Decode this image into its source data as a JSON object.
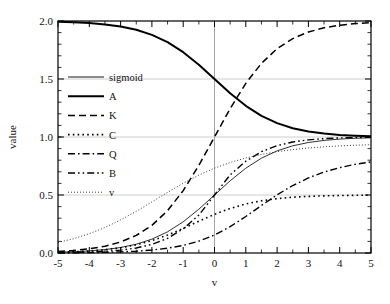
{
  "chart_data": {
    "type": "line",
    "title": "",
    "xlabel": "v",
    "ylabel": "value",
    "xlim": [
      -5,
      5
    ],
    "ylim": [
      0,
      2
    ],
    "grid": true,
    "grid_axis": "y",
    "legend_position": "upper-left-inside",
    "xticks": [
      "-5",
      "-4",
      "-3",
      "-2",
      "-1",
      "0",
      "1",
      "2",
      "3",
      "4",
      "5"
    ],
    "xtick_values": [
      -5,
      -4,
      -3,
      -2,
      -1,
      0,
      1,
      2,
      3,
      4,
      5
    ],
    "yticks": [
      "0.0",
      "0.5",
      "1.0",
      "1.5",
      "2.0"
    ],
    "ytick_values": [
      0,
      0.5,
      1.0,
      1.5,
      2.0
    ],
    "x": [
      -5,
      -4.5,
      -4,
      -3.5,
      -3,
      -2.5,
      -2,
      -1.5,
      -1,
      -0.5,
      0,
      0.5,
      1,
      1.5,
      2,
      2.5,
      3,
      3.5,
      4,
      4.5,
      5
    ],
    "series": [
      {
        "name": "sigmoid",
        "style": "solid",
        "width": 0.9,
        "color": "#1a1a1a",
        "values": [
          0.0067,
          0.011,
          0.018,
          0.0293,
          0.0474,
          0.0759,
          0.1192,
          0.1824,
          0.2689,
          0.3775,
          0.5,
          0.6225,
          0.7311,
          0.8176,
          0.8808,
          0.9241,
          0.9526,
          0.9707,
          0.982,
          0.989,
          0.9933
        ]
      },
      {
        "name": "A",
        "style": "solid",
        "width": 2.0,
        "color": "#000000",
        "values": [
          1.9933,
          1.989,
          1.982,
          1.9707,
          1.9526,
          1.9241,
          1.8808,
          1.8176,
          1.7311,
          1.6225,
          1.5,
          1.3775,
          1.2689,
          1.1824,
          1.1192,
          1.0759,
          1.0474,
          1.0293,
          1.018,
          1.011,
          1.0067
        ]
      },
      {
        "name": "K",
        "style": "dashed",
        "width": 1.5,
        "color": "#000000",
        "values": [
          0.0135,
          0.022,
          0.0359,
          0.0585,
          0.0949,
          0.1517,
          0.2384,
          0.3647,
          0.5379,
          0.7551,
          1.0,
          1.2449,
          1.4621,
          1.6353,
          1.7616,
          1.8483,
          1.9051,
          1.9415,
          1.9641,
          1.978,
          1.9866
        ]
      },
      {
        "name": "C",
        "style": "dotted",
        "width": 1.6,
        "color": "#000000",
        "values": [
          0.0067,
          0.0109,
          0.0177,
          0.0285,
          0.0453,
          0.0706,
          0.1066,
          0.1543,
          0.2119,
          0.2742,
          0.3333,
          0.3837,
          0.4226,
          0.4503,
          0.4689,
          0.4808,
          0.488,
          0.4925,
          0.4954,
          0.4972,
          0.4983
        ]
      },
      {
        "name": "Q",
        "style": "dashdot",
        "width": 1.4,
        "color": "#000000",
        "values": [
          0.0013,
          0.0022,
          0.0036,
          0.0059,
          0.0097,
          0.0157,
          0.0256,
          0.0412,
          0.0654,
          0.1019,
          0.155,
          0.2269,
          0.3147,
          0.41,
          0.5017,
          0.5818,
          0.6469,
          0.6976,
          0.736,
          0.7646,
          0.7857
        ]
      },
      {
        "name": "B",
        "style": "dashdotdot",
        "width": 1.4,
        "color": "#000000",
        "values": [
          0.0025,
          0.0045,
          0.0079,
          0.0141,
          0.0247,
          0.0431,
          0.0744,
          0.1265,
          0.2086,
          0.3263,
          0.5,
          0.6737,
          0.7914,
          0.8735,
          0.9256,
          0.9569,
          0.9753,
          0.9859,
          0.9921,
          0.9955,
          0.9975
        ]
      },
      {
        "name": "v",
        "style": "finedotted",
        "width": 1.0,
        "color": "#3a3a3a",
        "values": [
          0.0909,
          0.1237,
          0.1663,
          0.2199,
          0.2847,
          0.3594,
          0.4404,
          0.5227,
          0.601,
          0.6712,
          0.7311,
          0.7803,
          0.8194,
          0.8499,
          0.8735,
          0.8914,
          0.9051,
          0.9153,
          0.9231,
          0.9291,
          0.9337
        ]
      }
    ],
    "legend_entries": [
      {
        "label": "sigmoid",
        "style": "solid",
        "width": 0.9
      },
      {
        "label": "A",
        "style": "solid",
        "width": 2.0
      },
      {
        "label": "K",
        "style": "dashed",
        "width": 1.5
      },
      {
        "label": "C",
        "style": "dotted",
        "width": 1.6
      },
      {
        "label": "Q",
        "style": "dashdot",
        "width": 1.4
      },
      {
        "label": "B",
        "style": "dashdotdot",
        "width": 1.4
      },
      {
        "label": "v",
        "style": "finedotted",
        "width": 1.0
      }
    ],
    "colors": {
      "axis": "#000000",
      "grid": "#c8c8c8",
      "zero_line": "#9a9a9a",
      "background": "#ffffff"
    }
  }
}
